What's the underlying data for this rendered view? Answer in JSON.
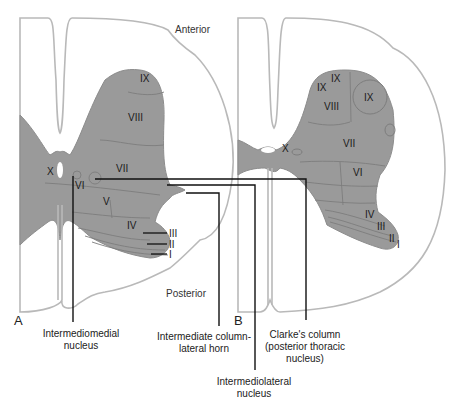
{
  "orientation": {
    "anterior": "Anterior",
    "posterior": "Posterior"
  },
  "panels": {
    "a": {
      "letter": "A",
      "laminae": [
        "IX",
        "VIII",
        "VII",
        "X",
        "VI",
        "V",
        "IV",
        "III",
        "II",
        "I"
      ]
    },
    "b": {
      "letter": "B",
      "laminae": [
        "IX",
        "IX",
        "IX",
        "VIII",
        "VII",
        "X",
        "VI",
        "IV",
        "III",
        "II",
        "I"
      ]
    }
  },
  "callouts": [
    {
      "id": "intermediomedial",
      "line1": "Intermediomedial",
      "line2": "nucleus"
    },
    {
      "id": "intermediate-column",
      "line1": "Intermediate column-",
      "line2": "lateral horn"
    },
    {
      "id": "intermediolateral",
      "line1": "Intermediolateral",
      "line2": "nucleus"
    },
    {
      "id": "clarkes-column",
      "line1": "Clarke's column",
      "line2": "(posterior thoracic",
      "line3": "nucleus)"
    }
  ],
  "colors": {
    "gray_matter": "#9a9a9a",
    "outline": "#b9b9b9",
    "leader_lines": "#111111"
  }
}
